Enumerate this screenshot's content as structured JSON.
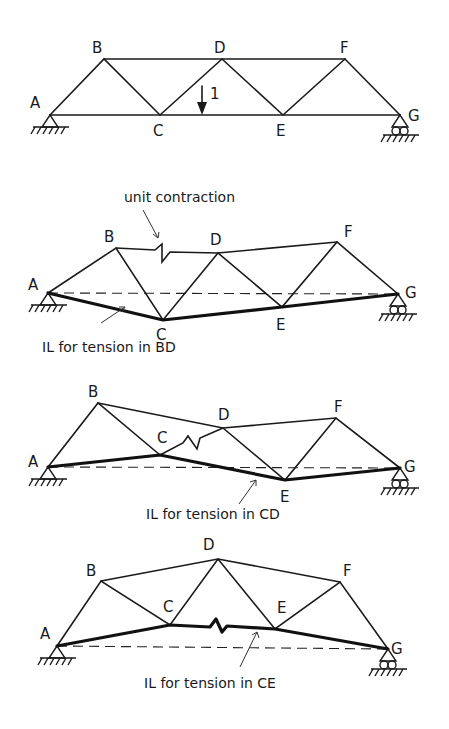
{
  "diagrams": [
    {
      "id": "original",
      "nodes": {
        "A": {
          "x": 50,
          "y": 115,
          "label": "A",
          "lx": 30,
          "ly": 108
        },
        "B": {
          "x": 104,
          "y": 59,
          "label": "B",
          "lx": 92,
          "ly": 53
        },
        "C": {
          "x": 160,
          "y": 115,
          "label": "C",
          "lx": 153,
          "ly": 136
        },
        "D": {
          "x": 222,
          "y": 59,
          "label": "D",
          "lx": 214,
          "ly": 53
        },
        "E": {
          "x": 283,
          "y": 115,
          "label": "E",
          "lx": 276,
          "ly": 136
        },
        "F": {
          "x": 345,
          "y": 59,
          "label": "F",
          "lx": 340,
          "ly": 53
        },
        "G": {
          "x": 400,
          "y": 115,
          "label": "G",
          "lx": 408,
          "ly": 121
        }
      },
      "load": {
        "label": "1",
        "x": 202,
        "y1": 86,
        "y2": 115
      }
    },
    {
      "id": "il-bd",
      "annotation": "unit contraction",
      "caption": "IL for tension in BD",
      "nodes": {
        "A": {
          "x": 48,
          "y": 293,
          "label": "A",
          "lx": 28,
          "ly": 290
        },
        "B": {
          "x": 116,
          "y": 248,
          "label": "B",
          "lx": 104,
          "ly": 242
        },
        "C": {
          "x": 163,
          "y": 320,
          "label": "C",
          "lx": 156,
          "ly": 340
        },
        "D": {
          "x": 218,
          "y": 253,
          "label": "D",
          "lx": 210,
          "ly": 245
        },
        "E": {
          "x": 282,
          "y": 307,
          "label": "E",
          "lx": 276,
          "ly": 330
        },
        "F": {
          "x": 337,
          "y": 242,
          "label": "F",
          "lx": 344,
          "ly": 237
        },
        "G": {
          "x": 398,
          "y": 294,
          "label": "G",
          "lx": 405,
          "ly": 298
        }
      }
    },
    {
      "id": "il-cd",
      "caption": "IL for tension in CD",
      "nodes": {
        "A": {
          "x": 48,
          "y": 467,
          "label": "A",
          "lx": 28,
          "ly": 467
        },
        "B": {
          "x": 98,
          "y": 403,
          "label": "B",
          "lx": 88,
          "ly": 397
        },
        "C": {
          "x": 160,
          "y": 455,
          "label": "C",
          "lx": 157,
          "ly": 443
        },
        "D": {
          "x": 223,
          "y": 428,
          "label": "D",
          "lx": 218,
          "ly": 420
        },
        "E": {
          "x": 285,
          "y": 480,
          "label": "E",
          "lx": 280,
          "ly": 502
        },
        "F": {
          "x": 336,
          "y": 418,
          "label": "F",
          "lx": 334,
          "ly": 412
        },
        "G": {
          "x": 400,
          "y": 468,
          "label": "G",
          "lx": 404,
          "ly": 472
        }
      }
    },
    {
      "id": "il-ce",
      "caption": "IL for tension in CE",
      "nodes": {
        "A": {
          "x": 57,
          "y": 646,
          "label": "A",
          "lx": 40,
          "ly": 639
        },
        "B": {
          "x": 101,
          "y": 581,
          "label": "B",
          "lx": 86,
          "ly": 576
        },
        "C": {
          "x": 170,
          "y": 625,
          "label": "C",
          "lx": 163,
          "ly": 612
        },
        "D": {
          "x": 218,
          "y": 559,
          "label": "D",
          "lx": 203,
          "ly": 550
        },
        "E": {
          "x": 275,
          "y": 629,
          "label": "E",
          "lx": 277,
          "ly": 613
        },
        "F": {
          "x": 340,
          "y": 582,
          "label": "F",
          "lx": 343,
          "ly": 576
        },
        "G": {
          "x": 388,
          "y": 649,
          "label": "G",
          "lx": 391,
          "ly": 654
        }
      }
    }
  ]
}
